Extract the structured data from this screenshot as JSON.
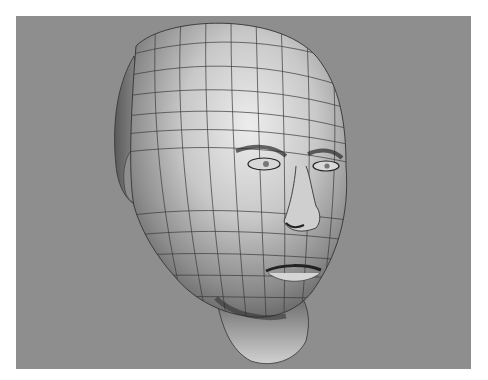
{
  "image": {
    "subject": "3D wireframe render of a male human head",
    "background_color": "#8e8e8e",
    "page_color": "#ffffff",
    "mesh_line_color": "#3a3a3a",
    "skin_highlight": "#e6e6e6",
    "skin_shadow": "#5a5a5a"
  }
}
